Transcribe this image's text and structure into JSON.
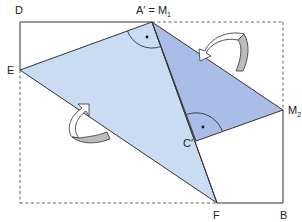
{
  "diagram": {
    "type": "geometry-paper-folding",
    "colors": {
      "light_triangle": "#c9dcf2",
      "dark_triangle": "#a9bde6",
      "outline": "#333333",
      "dashed": "#555555",
      "arrow_fill": "#ffffff",
      "arrow_shade": "#bcbcbc"
    },
    "labels": {
      "D": "D",
      "A_prime_eq_M": "A′ = M",
      "M1_sub": "1",
      "E": "E",
      "M2": "M",
      "M2_sub": "2",
      "C_prime": "C′",
      "F": "F",
      "B": "B"
    },
    "points": {
      "D": [
        21,
        22
      ],
      "A_prime": [
        152,
        22
      ],
      "E": [
        20,
        70
      ],
      "M2": [
        283,
        110
      ],
      "C_prime": [
        196,
        141
      ],
      "F": [
        217,
        203
      ],
      "B": [
        283,
        203
      ],
      "top_right": [
        283,
        22
      ],
      "bottom_left": [
        20,
        203
      ]
    },
    "right_angle_marks": [
      "A_prime",
      "C_prime"
    ],
    "fold_arrows": 2
  }
}
